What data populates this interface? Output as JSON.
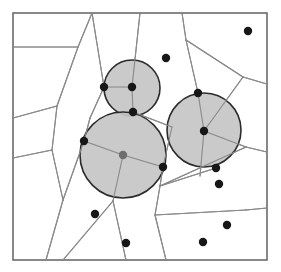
{
  "figure": {
    "type": "geometric-diagram",
    "canvas": {
      "width": 281,
      "height": 272,
      "background": "#ffffff"
    },
    "frame": {
      "x": 13,
      "y": 13,
      "width": 254,
      "height": 247,
      "stroke": "#6b6b6b",
      "stroke_width": 1.6
    },
    "style": {
      "edge_color": "#8a8a8a",
      "edge_width": 1.1,
      "disk_fill": "#c6c6c6",
      "disk_stroke": "#2b2b2b",
      "disk_stroke_width": 1.6,
      "dot_color": "#171717",
      "dot_radius": 4.2
    },
    "disks": [
      {
        "label": "disk-top",
        "cx": 132,
        "cy": 88,
        "r": 28
      },
      {
        "label": "disk-lower-left",
        "cx": 123,
        "cy": 155,
        "r": 43
      },
      {
        "label": "disk-right",
        "cx": 204,
        "cy": 130,
        "r": 37
      }
    ],
    "sites": [
      {
        "label": "site-1",
        "cx": 104,
        "cy": 87,
        "covered": true
      },
      {
        "label": "site-2",
        "cx": 132,
        "cy": 87,
        "covered": true
      },
      {
        "label": "site-3",
        "cx": 133,
        "cy": 112,
        "covered": true
      },
      {
        "label": "site-4",
        "cx": 84,
        "cy": 141,
        "covered": true
      },
      {
        "label": "site-5",
        "cx": 123,
        "cy": 155,
        "covered": true,
        "gray": true
      },
      {
        "label": "site-6",
        "cx": 163,
        "cy": 167,
        "covered": true
      },
      {
        "label": "site-7",
        "cx": 198,
        "cy": 93,
        "covered": true
      },
      {
        "label": "site-8",
        "cx": 204,
        "cy": 131,
        "covered": true
      },
      {
        "label": "site-9",
        "cx": 216,
        "cy": 168,
        "covered": true
      },
      {
        "label": "site-10",
        "cx": 166,
        "cy": 58,
        "covered": false
      },
      {
        "label": "site-11",
        "cx": 248,
        "cy": 31,
        "covered": false
      },
      {
        "label": "site-12",
        "cx": 219,
        "cy": 184,
        "covered": false
      },
      {
        "label": "site-13",
        "cx": 227,
        "cy": 225,
        "covered": false
      },
      {
        "label": "site-14",
        "cx": 203,
        "cy": 242,
        "covered": false
      },
      {
        "label": "site-15",
        "cx": 126,
        "cy": 243,
        "covered": false
      },
      {
        "label": "site-16",
        "cx": 95,
        "cy": 214,
        "covered": false
      }
    ],
    "edges": [
      {
        "label": "edge-top-left-horizontal",
        "points": "13,47 78,47"
      },
      {
        "label": "edge-up-to-top-border",
        "points": "78,47 92,13"
      },
      {
        "label": "edge-left-long-diagonal",
        "points": "78,47 57,106"
      },
      {
        "label": "edge-left-to-border",
        "points": "57,106 13,118"
      },
      {
        "label": "edge-left-lower",
        "points": "57,106 52,150"
      },
      {
        "label": "edge-left-lower-to-border",
        "points": "52,150 13,158"
      },
      {
        "label": "edge-left-cell-down",
        "points": "52,150 63,200"
      },
      {
        "label": "edge-left-cell-bottom",
        "points": "63,200 46,260"
      },
      {
        "label": "edge-mid-left-vertical",
        "points": "92,13 104,87"
      },
      {
        "label": "edge-site1-site2",
        "points": "104,87 132,87"
      },
      {
        "label": "edge-site2-up",
        "points": "132,87 140,13"
      },
      {
        "label": "edge-site2-down",
        "points": "132,87 133,112"
      },
      {
        "label": "edge-site1-down",
        "points": "104,87 90,118"
      },
      {
        "label": "edge-site3-right",
        "points": "133,112 172,127"
      },
      {
        "label": "edge-site3-left-down",
        "points": "90,118 84,141"
      },
      {
        "label": "edge-site4-center",
        "points": "84,141 123,155"
      },
      {
        "label": "edge-center-down",
        "points": "123,155 113,201"
      },
      {
        "label": "edge-center-right",
        "points": "123,155 163,167"
      },
      {
        "label": "edge-site6-up",
        "points": "163,167 172,127"
      },
      {
        "label": "edge-site6-down",
        "points": "163,167 160,186"
      },
      {
        "label": "edge-hub-down-left",
        "points": "113,201 63,260"
      },
      {
        "label": "edge-hub-down-right",
        "points": "113,201 126,260"
      },
      {
        "label": "edge-site7-up",
        "points": "198,93 186,40"
      },
      {
        "label": "edge-up-to-top",
        "points": "186,40 182,13"
      },
      {
        "label": "edge-top-right-diagonal",
        "points": "186,40 243,77"
      },
      {
        "label": "edge-right-to-border",
        "points": "243,77 267,84"
      },
      {
        "label": "edge-site7-site8",
        "points": "198,93 204,131"
      },
      {
        "label": "edge-site8-right",
        "points": "204,131 243,77"
      },
      {
        "label": "edge-site8-rightward",
        "points": "204,131 246,147"
      },
      {
        "label": "edge-right-mid-border",
        "points": "246,147 267,152"
      },
      {
        "label": "edge-site8-down",
        "points": "204,131 200,176"
      },
      {
        "label": "edge-site9-left",
        "points": "216,168 160,186"
      },
      {
        "label": "edge-site9-band",
        "points": "160,186 246,147"
      },
      {
        "label": "edge-lower-mid",
        "points": "160,186 155,215"
      },
      {
        "label": "edge-lower-band",
        "points": "155,215 246,210"
      },
      {
        "label": "edge-lower-band-border",
        "points": "246,210 267,208"
      },
      {
        "label": "edge-lower-mid-down",
        "points": "155,215 166,260"
      },
      {
        "label": "edge-center-left-diag",
        "points": "84,141 63,200"
      }
    ]
  }
}
